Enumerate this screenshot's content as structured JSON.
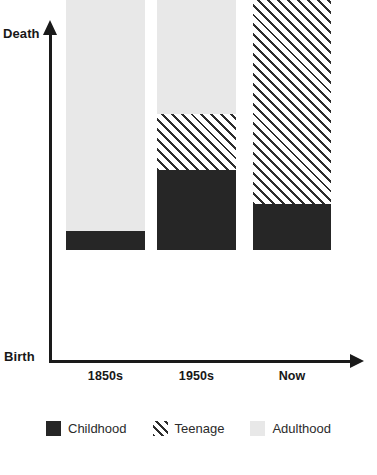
{
  "chart_data": {
    "type": "bar",
    "subtype": "stacked-bar",
    "title": "",
    "xlabel": "",
    "ylabel": "",
    "categories": [
      "1850s",
      "1950s",
      "Now"
    ],
    "axis": {
      "y_top_label": "Death",
      "y_bottom_label": "Birth",
      "y_axis_arrow": true,
      "x_axis_arrow": true,
      "grid": false,
      "tick_values_shown": false
    },
    "series": [
      {
        "name": "Childhood",
        "style": "solid-dark",
        "color": "#262626",
        "values": [
          6,
          24,
          14
        ]
      },
      {
        "name": "Teenage",
        "style": "diagonal-hatch",
        "color": "#2d2d2d",
        "values": [
          0,
          16,
          72
        ]
      },
      {
        "name": "Adulthood",
        "style": "solid-light",
        "color": "#e8e8e8",
        "values": [
          94,
          60,
          14
        ]
      }
    ],
    "stack_order_bottom_to_top": [
      "Childhood",
      "Teenage",
      "Adulthood"
    ],
    "ylim": [
      0,
      100
    ],
    "legend_position": "bottom-center",
    "legend": [
      "Childhood",
      "Teenage",
      "Adulthood"
    ]
  },
  "bars": [
    {
      "category": "1850s",
      "left": 66,
      "width": 79,
      "segments": [
        {
          "name": "Adulthood",
          "height_px": 320
        },
        {
          "name": "Teenage",
          "height_px": 0
        },
        {
          "name": "Childhood",
          "height_px": 19
        }
      ]
    },
    {
      "category": "1950s",
      "left": 157,
      "width": 79,
      "segments": [
        {
          "name": "Adulthood",
          "height_px": 203
        },
        {
          "name": "Teenage",
          "height_px": 56
        },
        {
          "name": "Childhood",
          "height_px": 80
        }
      ]
    },
    {
      "category": "Now",
      "left": 253,
      "width": 78,
      "segments": [
        {
          "name": "Adulthood",
          "height_px": 49
        },
        {
          "name": "Teenage",
          "height_px": 244
        },
        {
          "name": "Childhood",
          "height_px": 46
        }
      ]
    }
  ],
  "legend_items": [
    {
      "label": "Childhood",
      "swatch": "childhood"
    },
    {
      "label": "Teenage",
      "swatch": "teenage"
    },
    {
      "label": "Adulthood",
      "swatch": "adulthood"
    }
  ],
  "colors": {
    "childhood": "#262626",
    "teenage": "#2d2d2d",
    "adulthood": "#e8e8e8",
    "axis": "#1a1a1a",
    "text": "#171717",
    "background": "#ffffff"
  }
}
